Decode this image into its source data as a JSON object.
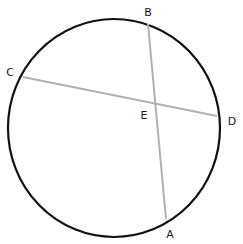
{
  "diagram": {
    "type": "circle-intersecting-chords",
    "circle": {
      "cx": 114,
      "cy": 128,
      "rx": 106,
      "ry": 109,
      "stroke": "#111111",
      "stroke_width": 2.2
    },
    "chord_color": "#b0b0b0",
    "chords": [
      {
        "name": "BA",
        "from": "B",
        "to": "A"
      },
      {
        "name": "CD",
        "from": "C",
        "to": "D"
      }
    ],
    "points": {
      "B": {
        "x": 148,
        "y": 24
      },
      "A": {
        "x": 166,
        "y": 219
      },
      "C": {
        "x": 23,
        "y": 77
      },
      "D": {
        "x": 217,
        "y": 116
      },
      "E": {
        "x": 154,
        "y": 102
      }
    },
    "labels": {
      "B": {
        "text": "B",
        "x": 148,
        "y": 16
      },
      "C": {
        "text": "C",
        "x": 10,
        "y": 76
      },
      "E": {
        "text": "E",
        "x": 144,
        "y": 119
      },
      "D": {
        "text": "D",
        "x": 232,
        "y": 125
      },
      "A": {
        "text": "A",
        "x": 170,
        "y": 238
      }
    }
  }
}
